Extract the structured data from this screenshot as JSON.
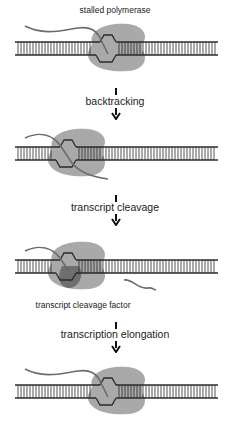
{
  "figure": {
    "colors": {
      "polymerase": "#a9a9a9",
      "cleavage_factor": "#6f6f6f",
      "dna": "#2a2a2a",
      "rna": "#6b6b6b",
      "background": "#ffffff"
    },
    "panels": [
      {
        "id": "p1",
        "label": "stalled polymerase",
        "state": "stalled"
      },
      {
        "id": "p2",
        "label": "",
        "state": "backtracked"
      },
      {
        "id": "p3",
        "label": "transcript cleavage factor",
        "state": "cleaved"
      },
      {
        "id": "p4",
        "label": "",
        "state": "elongating"
      }
    ],
    "steps": [
      {
        "label": "backtracking"
      },
      {
        "label": "transcript cleavage"
      },
      {
        "label": "transcription elongation"
      }
    ]
  }
}
